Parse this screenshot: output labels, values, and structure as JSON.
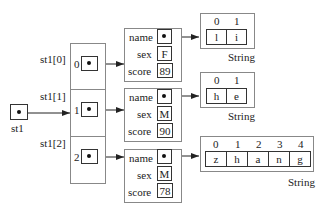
{
  "pointer": {
    "label": "st1"
  },
  "array": {
    "elements": [
      {
        "label": "st1[0]",
        "index": "0"
      },
      {
        "label": "st1[1]",
        "index": "1"
      },
      {
        "label": "st1[2]",
        "index": "2"
      }
    ]
  },
  "records": [
    {
      "fields": {
        "name_label": "name",
        "sex_label": "sex",
        "score_label": "score"
      },
      "sex": "F",
      "score": "89"
    },
    {
      "fields": {
        "name_label": "name",
        "sex_label": "sex",
        "score_label": "score"
      },
      "sex": "M",
      "score": "90"
    },
    {
      "fields": {
        "name_label": "name",
        "sex_label": "sex",
        "score_label": "score"
      },
      "sex": "M",
      "score": "78"
    }
  ],
  "strings": [
    {
      "type_label": "String",
      "indices": [
        "0",
        "1"
      ],
      "chars": [
        "l",
        "i"
      ]
    },
    {
      "type_label": "String",
      "indices": [
        "0",
        "1"
      ],
      "chars": [
        "h",
        "e"
      ]
    },
    {
      "type_label": "String",
      "indices": [
        "0",
        "1",
        "2",
        "3",
        "4"
      ],
      "chars": [
        "z",
        "h",
        "a",
        "n",
        "g"
      ]
    }
  ]
}
